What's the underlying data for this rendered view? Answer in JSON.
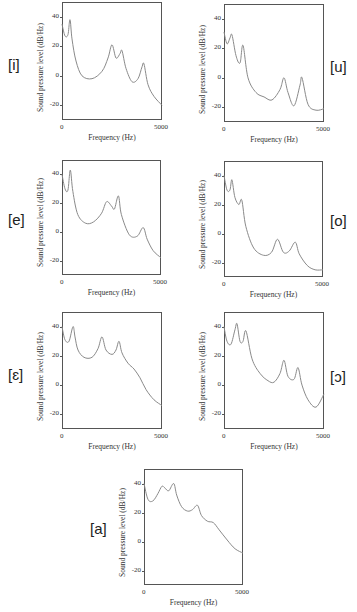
{
  "axis_common": {
    "ylabel": "Sound pressure level (dB/Hz)",
    "xlabel": "Frequency (Hz)",
    "xticks": [
      "0",
      "5000"
    ],
    "yticks": [
      "40",
      "20",
      "0",
      "-20"
    ]
  },
  "panels": [
    {
      "vowel": "[i]"
    },
    {
      "vowel": "[u]"
    },
    {
      "vowel": "[e]"
    },
    {
      "vowel": "[o]"
    },
    {
      "vowel": "[ɛ]"
    },
    {
      "vowel": "[ɔ]"
    },
    {
      "vowel": "[a]"
    }
  ],
  "chart_data": [
    {
      "type": "line",
      "title": "[i]",
      "xlabel": "Frequency (Hz)",
      "ylabel": "Sound pressure level (dB/Hz)",
      "xlim": [
        0,
        5000
      ],
      "ylim": [
        -30,
        50
      ],
      "yticks": [
        40,
        20,
        0,
        -20
      ],
      "xticks": [
        0,
        5000
      ],
      "grid": false,
      "x": [
        0,
        150,
        300,
        400,
        500,
        700,
        1000,
        1500,
        2000,
        2300,
        2500,
        2700,
        2900,
        3000,
        3200,
        3500,
        3800,
        4000,
        4100,
        4300,
        4600,
        5000
      ],
      "y": [
        35,
        27,
        28,
        38,
        25,
        10,
        0,
        -2,
        3,
        12,
        21,
        12,
        15,
        17,
        5,
        -4,
        -2,
        6,
        8,
        -6,
        -14,
        -20
      ]
    },
    {
      "type": "line",
      "title": "[u]",
      "xlabel": "Frequency (Hz)",
      "ylabel": "Sound pressure level (dB/Hz)",
      "xlim": [
        0,
        5000
      ],
      "ylim": [
        -30,
        50
      ],
      "yticks": [
        40,
        20,
        0,
        -20
      ],
      "xticks": [
        0,
        5000
      ],
      "grid": false,
      "x": [
        0,
        150,
        300,
        400,
        600,
        800,
        950,
        1200,
        1600,
        2000,
        2400,
        2800,
        3000,
        3200,
        3500,
        3800,
        3900,
        4200,
        4600,
        5000
      ],
      "y": [
        31,
        23,
        27,
        29,
        15,
        10,
        22,
        0,
        -10,
        -13,
        -15,
        -8,
        0,
        -10,
        -19,
        -5,
        0,
        -18,
        -22,
        -21
      ]
    },
    {
      "type": "line",
      "title": "[e]",
      "xlabel": "Frequency (Hz)",
      "ylabel": "Sound pressure level (dB/Hz)",
      "xlim": [
        0,
        5000
      ],
      "ylim": [
        -30,
        50
      ],
      "yticks": [
        40,
        20,
        0,
        -20
      ],
      "xticks": [
        0,
        5000
      ],
      "grid": false,
      "x": [
        0,
        150,
        300,
        420,
        550,
        800,
        1200,
        1600,
        2000,
        2250,
        2500,
        2650,
        2850,
        3000,
        3400,
        3800,
        4100,
        4300,
        4600,
        5000
      ],
      "y": [
        40,
        30,
        29,
        43,
        28,
        12,
        6,
        7,
        13,
        21,
        18,
        16,
        25,
        12,
        -2,
        -3,
        3,
        -5,
        -13,
        -18
      ]
    },
    {
      "type": "line",
      "title": "[o]",
      "xlabel": "Frequency (Hz)",
      "ylabel": "Sound pressure level (dB/Hz)",
      "xlim": [
        0,
        5000
      ],
      "ylim": [
        -30,
        50
      ],
      "yticks": [
        40,
        20,
        0,
        -20
      ],
      "xticks": [
        0,
        5000
      ],
      "grid": false,
      "x": [
        0,
        150,
        300,
        400,
        550,
        750,
        900,
        1100,
        1500,
        2000,
        2400,
        2700,
        3000,
        3300,
        3600,
        3800,
        4200,
        4600,
        5000
      ],
      "y": [
        40,
        30,
        30,
        37,
        25,
        20,
        23,
        5,
        -10,
        -15,
        -13,
        -4,
        -13,
        -12,
        -6,
        -14,
        -22,
        -25,
        -25
      ]
    },
    {
      "type": "line",
      "title": "[ɛ]",
      "xlabel": "Frequency (Hz)",
      "ylabel": "Sound pressure level (dB/Hz)",
      "xlim": [
        0,
        5000
      ],
      "ylim": [
        -30,
        50
      ],
      "yticks": [
        40,
        20,
        0,
        -20
      ],
      "xticks": [
        0,
        5000
      ],
      "grid": false,
      "x": [
        0,
        150,
        350,
        550,
        650,
        800,
        1100,
        1500,
        1800,
        2000,
        2200,
        2500,
        2700,
        2850,
        3000,
        3300,
        3600,
        3900,
        4200,
        4600,
        5000
      ],
      "y": [
        40,
        31,
        30,
        40,
        33,
        24,
        19,
        19,
        25,
        33,
        24,
        21,
        24,
        30,
        22,
        15,
        11,
        5,
        -3,
        -10,
        -14
      ]
    },
    {
      "type": "line",
      "title": "[ɔ]",
      "xlabel": "Frequency (Hz)",
      "ylabel": "Sound pressure level (dB/Hz)",
      "xlim": [
        0,
        5000
      ],
      "ylim": [
        -30,
        50
      ],
      "yticks": [
        40,
        20,
        0,
        -20
      ],
      "xticks": [
        0,
        5000
      ],
      "grid": false,
      "x": [
        0,
        150,
        350,
        550,
        650,
        800,
        950,
        1100,
        1400,
        1800,
        2200,
        2500,
        2800,
        3000,
        3200,
        3500,
        3700,
        3900,
        4200,
        4600,
        5000
      ],
      "y": [
        40,
        30,
        28,
        38,
        42,
        30,
        30,
        37,
        18,
        8,
        3,
        2,
        8,
        17,
        6,
        4,
        12,
        0,
        -10,
        -15,
        -6
      ]
    },
    {
      "type": "line",
      "title": "[a]",
      "xlabel": "Frequency (Hz)",
      "ylabel": "Sound pressure level (dB/Hz)",
      "xlim": [
        0,
        5000
      ],
      "ylim": [
        -30,
        50
      ],
      "yticks": [
        40,
        20,
        0,
        -20
      ],
      "xticks": [
        0,
        5000
      ],
      "grid": false,
      "x": [
        0,
        200,
        450,
        700,
        900,
        1050,
        1250,
        1500,
        1650,
        1900,
        2200,
        2450,
        2700,
        2900,
        3200,
        3500,
        3800,
        4200,
        4600,
        5000
      ],
      "y": [
        40,
        29,
        28,
        33,
        38,
        37,
        35,
        40,
        32,
        24,
        21,
        22,
        25,
        18,
        14,
        13,
        8,
        1,
        -5,
        -8
      ]
    }
  ]
}
